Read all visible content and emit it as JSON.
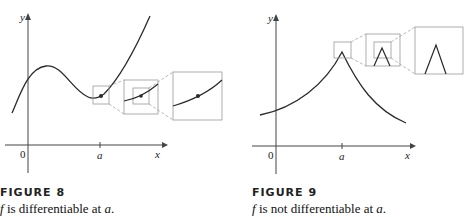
{
  "figures": [
    {
      "id": "figure-8",
      "label": "FIGURE 8",
      "caption_f": "f",
      "caption_mid": " is differentiable at ",
      "caption_a": "a",
      "caption_end": ".",
      "axes": {
        "y_label": "y",
        "x_label": "x",
        "origin_label": "0",
        "tick_label": "a"
      },
      "description": "Smooth curve with point at a; successive zoom boxes show curve becoming straight line"
    },
    {
      "id": "figure-9",
      "label": "FIGURE 9",
      "caption_f": "f",
      "caption_mid": " is not differentiable at ",
      "caption_a": "a",
      "caption_end": ".",
      "axes": {
        "y_label": "y",
        "x_label": "x",
        "origin_label": "0",
        "tick_label": "a"
      },
      "description": "Curve with a corner (cusp) at a; successive zoom boxes keep showing a sharp corner"
    }
  ],
  "colors": {
    "curve": "#2a2a2a",
    "axis": "#444444",
    "box": "#999999"
  }
}
